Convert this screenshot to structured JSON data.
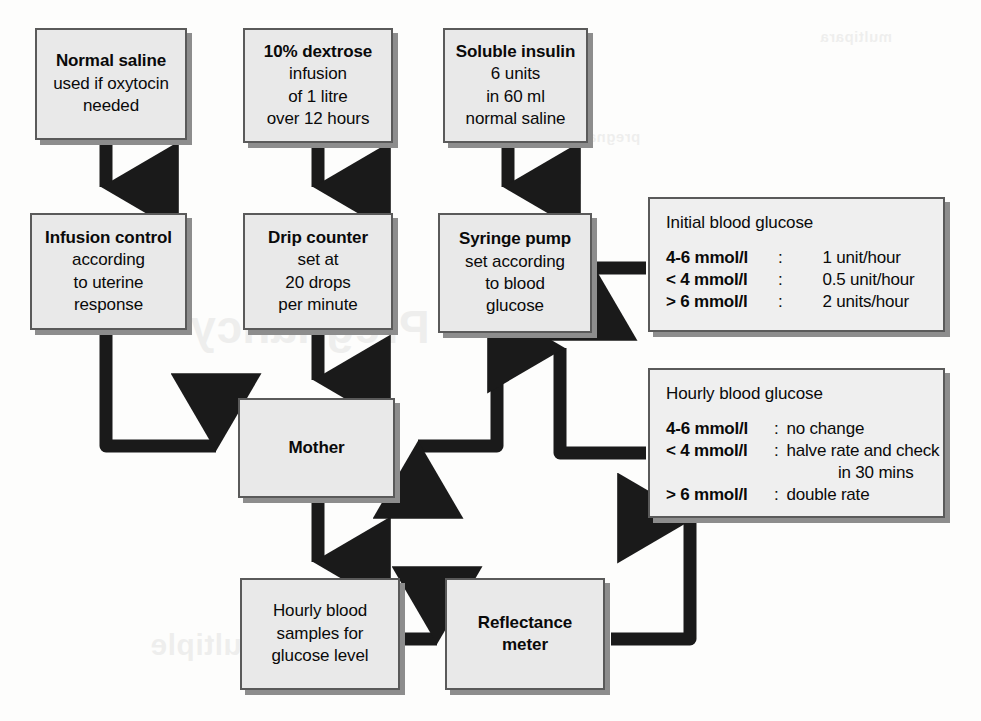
{
  "diagram": {
    "nodes": {
      "normal_saline": {
        "title": "Normal saline",
        "lines": [
          "used if oxytocin",
          "needed"
        ]
      },
      "dextrose": {
        "title": "10% dextrose",
        "lines": [
          "infusion",
          "of 1 litre",
          "over 12 hours"
        ]
      },
      "insulin": {
        "title": "Soluble insulin",
        "lines": [
          "6 units",
          "in 60 ml",
          "normal saline"
        ]
      },
      "infusion_control": {
        "title": "Infusion control",
        "lines": [
          "according",
          "to uterine",
          "response"
        ]
      },
      "drip_counter": {
        "title": "Drip counter",
        "lines": [
          "set at",
          "20 drops",
          "per minute"
        ]
      },
      "syringe_pump": {
        "title": "Syringe pump",
        "lines": [
          "set according",
          "to blood",
          "glucose"
        ]
      },
      "mother": {
        "title": "Mother",
        "lines": []
      },
      "blood_samples": {
        "title": "Hourly blood",
        "lines": [
          "samples for",
          "glucose level"
        ]
      },
      "reflectance_meter": {
        "title": "Reflectance",
        "lines": [
          "meter"
        ]
      }
    },
    "panels": {
      "initial": {
        "heading": "Initial blood glucose",
        "rules": [
          {
            "condition": "4-6 mmol/l",
            "separator": ":",
            "action": "1 unit/hour"
          },
          {
            "condition": "< 4 mmol/l",
            "separator": ":",
            "action": "0.5 unit/hour"
          },
          {
            "condition": "> 6 mmol/l",
            "separator": ":",
            "action": "2 units/hour"
          }
        ]
      },
      "hourly": {
        "heading": "Hourly blood glucose",
        "rules": [
          {
            "condition": "4-6 mmol/l",
            "separator": ":",
            "action": "no change"
          },
          {
            "condition": "< 4 mmol/l",
            "separator": ":",
            "action": "halve rate and check",
            "continuation": "in 30 mins"
          },
          {
            "condition": "> 6 mmol/l",
            "separator": ":",
            "action": "double rate"
          }
        ]
      }
    },
    "ghost_text": {
      "line1": "multipara",
      "line2": "pregnancy",
      "line3": "Pregnancy",
      "line4": "multiple"
    },
    "colors": {
      "box_fill": "#e9e9e9",
      "panel_fill": "#efefef",
      "box_border": "#5a5a5a",
      "box_shadow": "#8d8d8d",
      "connector": "#1a1a1a",
      "text": "#0a0a0a",
      "page": "#fdfdfc"
    }
  }
}
